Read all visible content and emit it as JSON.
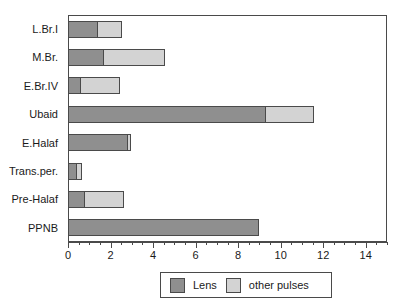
{
  "chart_data": {
    "type": "bar",
    "orientation": "horizontal",
    "stacked": true,
    "title": "",
    "xlabel": "",
    "ylabel": "",
    "xlim": [
      0,
      15
    ],
    "grid": false,
    "legend_position": "bottom",
    "categories": [
      "L.Br.I",
      "M.Br.",
      "E.Br.IV",
      "Ubaid",
      "E.Halaf",
      "Trans.per.",
      "Pre-Halaf",
      "PPNB"
    ],
    "series": [
      {
        "name": "Lens",
        "color": "#8f8f8f",
        "values": [
          1.4,
          1.7,
          0.6,
          9.3,
          2.8,
          0.4,
          0.8,
          9.0
        ]
      },
      {
        "name": "other pulses",
        "color": "#d3d3d3",
        "values": [
          1.2,
          2.9,
          1.9,
          2.3,
          0.2,
          0.3,
          1.9,
          0.0
        ]
      }
    ],
    "xticks_major": [
      0,
      2,
      4,
      6,
      8,
      10,
      12,
      14
    ],
    "xtick_labels": [
      "0",
      "2",
      "4",
      "6",
      "8",
      "10",
      "12",
      "14"
    ],
    "xticks_minor": [
      0.5,
      1,
      1.5,
      2.5,
      3,
      3.5,
      4.5,
      5,
      5.5,
      6.5,
      7,
      7.5,
      8.5,
      9,
      9.5,
      10.5,
      11,
      11.5,
      12.5,
      13,
      13.5,
      14.5,
      15
    ]
  },
  "legend": {
    "entries": [
      {
        "label": "Lens",
        "color": "#8f8f8f"
      },
      {
        "label": "other pulses",
        "color": "#d3d3d3"
      }
    ]
  },
  "colors": {
    "lens": "#8f8f8f",
    "other_pulses": "#d3d3d3",
    "axis": "#4a4a4a",
    "text": "#1a1a1a",
    "background": "#ffffff"
  }
}
